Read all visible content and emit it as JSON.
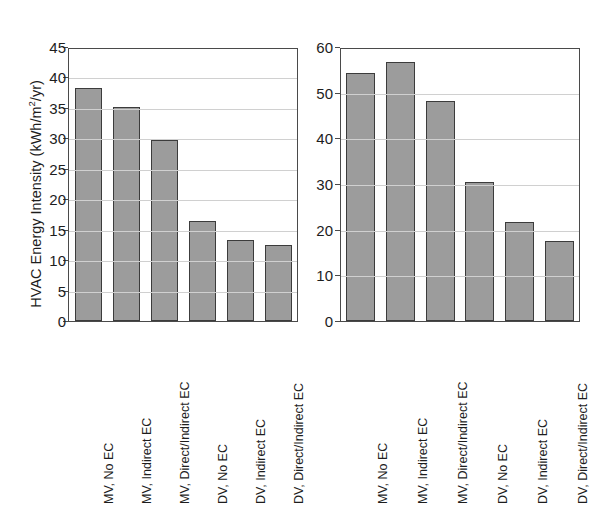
{
  "figure": {
    "ylabel_main": "HVAC Energy Intensity (kWh/m",
    "ylabel_sup": "2",
    "ylabel_tail": "/yr)"
  },
  "chart_data": {
    "type": "bar",
    "title": "",
    "xlabel": "",
    "ylabel": "HVAC Energy Intensity (kWh/m2/yr)",
    "grid": true,
    "legend": "none",
    "panels": [
      {
        "name": "oakland",
        "title": "Oakland",
        "categories": [
          "MV, No EC",
          "MV, Indirect EC",
          "MV, Direct/Indirect EC",
          "DV, No EC",
          "DV, Indirect EC",
          "DV, Direct/Indirect EC"
        ],
        "values": [
          38.3,
          35.2,
          29.7,
          16.4,
          13.3,
          12.4
        ],
        "ylim": [
          0,
          45
        ],
        "yticks": [
          0,
          5,
          10,
          15,
          20,
          25,
          30,
          35,
          40,
          45
        ],
        "ytick_labels": [
          "0",
          "5",
          "10",
          "15",
          "20",
          "25",
          "30",
          "35",
          "40",
          "45"
        ]
      },
      {
        "name": "san-diego",
        "title": "San Diego",
        "categories": [
          "MV, No EC",
          "MV, Indirect EC",
          "MV, Direct/Indirect EC",
          "DV, No EC",
          "DV, Indirect EC",
          "DV, Direct/Indirect EC"
        ],
        "values": [
          54.3,
          56.7,
          48.2,
          30.5,
          21.7,
          17.5
        ],
        "ylim": [
          0,
          60
        ],
        "yticks": [
          0,
          10,
          20,
          30,
          40,
          50,
          60
        ],
        "ytick_labels": [
          "0",
          "10",
          "20",
          "30",
          "40",
          "50",
          "60"
        ]
      }
    ],
    "colors": {
      "bar_fill": "#9c9c9c",
      "bar_edge": "#3c3c3c",
      "grid": "#d0d0d0",
      "axis": "#4a4a4a",
      "text": "#1d1d1d",
      "background": "#ffffff"
    }
  }
}
